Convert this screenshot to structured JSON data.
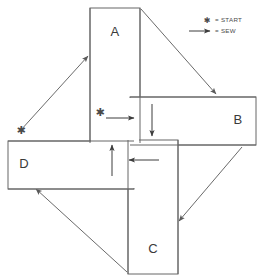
{
  "diagram": {
    "pieces": [
      {
        "id": "A",
        "label": "A",
        "position": "top-vertical",
        "x": 90,
        "y": 8,
        "w": 50,
        "h": 135
      },
      {
        "id": "B",
        "label": "B",
        "position": "right-horizontal",
        "x": 130,
        "y": 97,
        "w": 126,
        "h": 48
      },
      {
        "id": "C",
        "label": "C",
        "position": "bottom-vertical",
        "x": 128,
        "y": 140,
        "w": 50,
        "h": 134
      },
      {
        "id": "D",
        "label": "D",
        "position": "left-horizontal",
        "x": 8,
        "y": 141,
        "w": 126,
        "h": 48
      }
    ],
    "start_markers": [
      {
        "name": "start-marker-outer",
        "glyph": "✱",
        "x": 21,
        "y": 131
      },
      {
        "name": "start-marker-inner",
        "glyph": "✱",
        "x": 100,
        "y": 113
      }
    ],
    "sew_arrows_inner": [
      {
        "name": "sew-arrow-right",
        "direction": "right",
        "x1": 106,
        "y1": 118,
        "x2": 133,
        "y2": 118
      },
      {
        "name": "sew-arrow-down",
        "direction": "down",
        "x1": 152,
        "y1": 104,
        "x2": 152,
        "y2": 135
      },
      {
        "name": "sew-arrow-left",
        "direction": "left",
        "x1": 158,
        "y1": 160,
        "x2": 128,
        "y2": 160
      },
      {
        "name": "sew-arrow-up",
        "direction": "up",
        "x1": 112,
        "y1": 175,
        "x2": 112,
        "y2": 144
      }
    ],
    "sew_arrows_outer": [
      {
        "name": "sew-arrow-diagonal-upper-left",
        "direction": "up-right",
        "x1": 20,
        "y1": 131,
        "x2": 88,
        "y2": 56
      },
      {
        "name": "sew-arrow-diagonal-upper-right",
        "direction": "down-right",
        "x1": 141,
        "y1": 9,
        "x2": 216,
        "y2": 94
      },
      {
        "name": "sew-arrow-diagonal-lower-right",
        "direction": "down-left",
        "x1": 242,
        "y1": 147,
        "x2": 178,
        "y2": 222
      },
      {
        "name": "sew-arrow-diagonal-lower-left",
        "direction": "up-left",
        "x1": 127,
        "y1": 272,
        "x2": 35,
        "y2": 188
      }
    ]
  },
  "legend": {
    "name": "legend",
    "items": [
      {
        "symbol": "✱",
        "symbol_name": "start-star-icon",
        "equals": "= START",
        "label": "START"
      },
      {
        "symbol": "→",
        "symbol_name": "sew-arrow-icon",
        "equals": "= SEW",
        "label": "SEW"
      }
    ]
  },
  "colors": {
    "piece_stroke": "#666666",
    "piece_fill": "#ffffff",
    "arrow": "#3c3c3c",
    "diagonal": "#6a6a6a",
    "text": "#4a4a4a",
    "background": "#ffffff"
  }
}
